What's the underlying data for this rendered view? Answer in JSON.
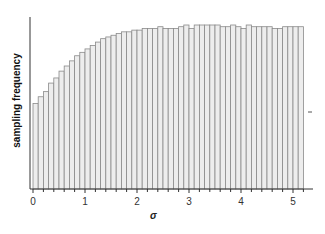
{
  "chart_data": {
    "type": "bar",
    "title": "",
    "xlabel": "σ",
    "ylabel": "sampling frequency",
    "xlim": [
      0,
      5.3
    ],
    "x_ticks": [
      "0",
      "1",
      "2",
      "3",
      "4",
      "5"
    ],
    "bin_width": 0.1,
    "grid": false,
    "legend": null,
    "x": [
      0.0,
      0.1,
      0.2,
      0.3,
      0.4,
      0.5,
      0.6,
      0.7,
      0.8,
      0.9,
      1.0,
      1.1,
      1.2,
      1.3,
      1.4,
      1.5,
      1.6,
      1.7,
      1.8,
      1.9,
      2.0,
      2.1,
      2.2,
      2.3,
      2.4,
      2.5,
      2.6,
      2.7,
      2.8,
      2.9,
      3.0,
      3.1,
      3.2,
      3.3,
      3.4,
      3.5,
      3.6,
      3.7,
      3.8,
      3.9,
      4.0,
      4.1,
      4.2,
      4.3,
      4.4,
      4.5,
      4.6,
      4.7,
      4.8,
      4.9,
      5.0,
      5.1
    ],
    "values": [
      50,
      54,
      57,
      62,
      65,
      69,
      72,
      75,
      78,
      80,
      82,
      84,
      86,
      88,
      89,
      90,
      91,
      92,
      92,
      93,
      93,
      94,
      94,
      94,
      95,
      94,
      94,
      94,
      95,
      96,
      94,
      96,
      96,
      96,
      96,
      96,
      95,
      95,
      96,
      95,
      94,
      96,
      95,
      95,
      95,
      95,
      94,
      94,
      95,
      95,
      95,
      95
    ]
  },
  "labels": {
    "ylabel": "sampling frequency",
    "xlabel": "σ"
  }
}
